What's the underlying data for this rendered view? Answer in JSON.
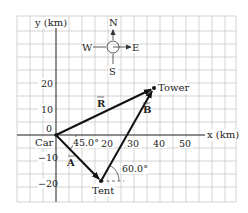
{
  "diagram": {
    "type": "vector-displacement",
    "grid": {
      "spacing_km": 5,
      "color": "#c8c8c8",
      "x_range_km": [
        -15,
        70
      ],
      "y_range_km": [
        -25,
        45
      ]
    },
    "axes": {
      "x_label": "x (km)",
      "y_label": "y (km)",
      "x_ticks": [
        "20",
        "30",
        "40",
        "50"
      ],
      "y_ticks": [
        "20",
        "10",
        "0",
        "−10",
        "−20"
      ]
    },
    "compass": {
      "north": "N",
      "south": "S",
      "east": "E",
      "west": "W"
    },
    "points": {
      "car": {
        "label": "Car",
        "x_km": 0,
        "y_km": 0
      },
      "tent": {
        "label": "Tent",
        "x_km": 17.0,
        "y_km": -17.7
      },
      "tower": {
        "label": "Tower",
        "x_km": 37.8,
        "y_km": 18.1
      }
    },
    "vectors": [
      {
        "name": "A",
        "label": "A",
        "from": "car",
        "to": "tent"
      },
      {
        "name": "B",
        "label": "B",
        "from": "tent",
        "to": "tower"
      },
      {
        "name": "R",
        "label": "R",
        "from": "car",
        "to": "tower"
      }
    ],
    "angles": [
      {
        "label": "45.0°",
        "at": "car"
      },
      {
        "label": "60.0°",
        "at": "tent"
      }
    ],
    "colors": {
      "vector": "#111111",
      "axis": "#333333",
      "grid": "#c8c8c8"
    }
  }
}
